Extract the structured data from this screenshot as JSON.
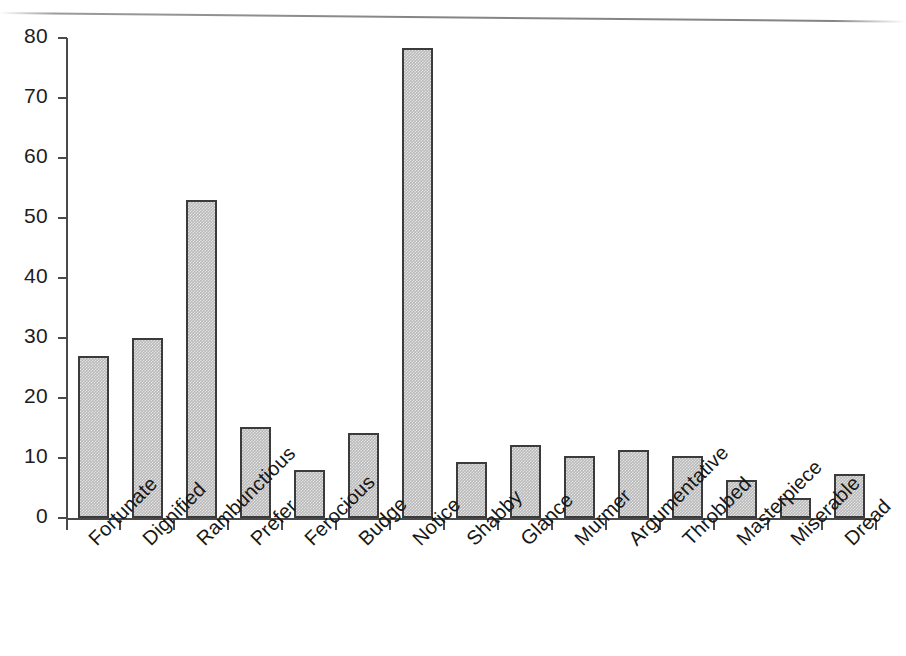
{
  "chart_data": {
    "type": "bar",
    "title": "",
    "subtitle": "",
    "xlabel": "",
    "ylabel": "",
    "categories": [
      "Fortunate",
      "Dignified",
      "Rambunctious",
      "Prefer",
      "Ferocious",
      "Budge",
      "Notice",
      "Shabby",
      "Glance",
      "Murmer",
      "Argumentative",
      "Throbbed",
      "Masterpiece",
      "Miserable",
      "Dread"
    ],
    "values": [
      27,
      30,
      53,
      15.2,
      8,
      14.2,
      78.3,
      9.3,
      12.2,
      10.3,
      11.4,
      10.4,
      6.3,
      3.3,
      7.4
    ],
    "ylim": [
      0,
      80
    ],
    "y_ticks": [
      0,
      10,
      20,
      30,
      40,
      50,
      60,
      70,
      80
    ],
    "y_tick_labels": [
      "0",
      "10",
      "20",
      "30",
      "40",
      "50",
      "60",
      "70",
      "80"
    ],
    "grid": false,
    "legend": false,
    "legend_position": "none",
    "bar_fill_color": "#b9b9b9",
    "bar_border_color": "#3b3b3b",
    "axis_color": "#4a4a4a",
    "background_color": "#ffffff",
    "x_tick_label_rotation": -45
  }
}
